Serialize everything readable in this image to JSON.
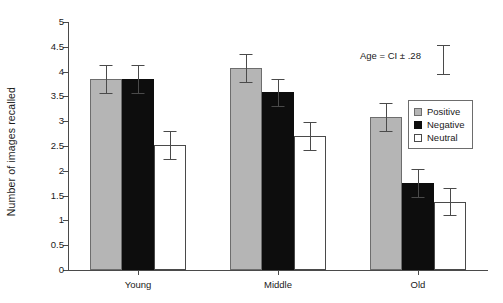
{
  "chart_data": {
    "type": "bar",
    "title": "",
    "xlabel": "",
    "ylabel": "Number of images recalled",
    "categories": [
      "Young",
      "Middle",
      "Old"
    ],
    "ylim": [
      0,
      5
    ],
    "ytick_step": 0.5,
    "yticks": [
      "0",
      "0.5",
      "1",
      "1.5",
      "2",
      "2.5",
      "3",
      "3.5",
      "4",
      "4.5",
      "5"
    ],
    "ytick_values": [
      0,
      0.5,
      1,
      1.5,
      2,
      2.5,
      3,
      3.5,
      4,
      4.5,
      5
    ],
    "grid": false,
    "legend_position": "right",
    "error_type": "CI",
    "error_value": 0.28,
    "series": [
      {
        "name": "Positive",
        "color": "#b5b5b5",
        "values": [
          3.85,
          4.08,
          3.08
        ],
        "errors": [
          0.28,
          0.28,
          0.28
        ]
      },
      {
        "name": "Negative",
        "color": "#0d0d0d",
        "values": [
          3.85,
          3.58,
          1.75
        ],
        "errors": [
          0.28,
          0.28,
          0.28
        ]
      },
      {
        "name": "Neutral",
        "color": "#ffffff",
        "values": [
          2.52,
          2.7,
          1.38
        ],
        "errors": [
          0.28,
          0.28,
          0.28
        ]
      }
    ],
    "annotations": [
      {
        "text": "Age = CI ± .28"
      }
    ]
  },
  "legend": {
    "items": [
      {
        "label": "Positive",
        "swatch": "gray-filled-swatch"
      },
      {
        "label": "Negative",
        "swatch": "black-filled-swatch"
      },
      {
        "label": "Neutral",
        "swatch": "white-open-swatch"
      }
    ]
  },
  "annotation": {
    "text": "Age = CI ± .28"
  },
  "axes": {
    "y_title": "Number of images recalled"
  }
}
